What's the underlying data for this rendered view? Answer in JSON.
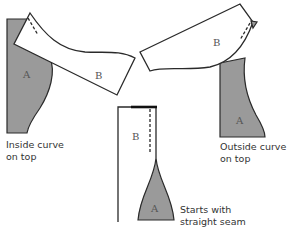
{
  "diagram": {
    "pieces": {
      "left": {
        "under_label": "A",
        "over_label": "B"
      },
      "right": {
        "under_label": "A",
        "over_label": "B"
      },
      "center": {
        "under_label": "A",
        "over_label": "B"
      }
    },
    "captions": {
      "left": {
        "line1": "Inside curve",
        "line2": "on top"
      },
      "right": {
        "line1": "Outside curve",
        "line2": "on top"
      },
      "center": {
        "line1": "Starts with",
        "line2": "straight seam"
      }
    },
    "colors": {
      "under_fabric": "#9a9a9a",
      "over_fabric": "#ffffff",
      "outline": "#2a2a2a"
    }
  }
}
